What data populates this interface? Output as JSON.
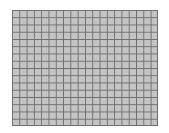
{
  "grid": {
    "columns": 20,
    "rows": 16,
    "fill_color": "#c4c4c4",
    "line_color": "#6e6e6e"
  }
}
